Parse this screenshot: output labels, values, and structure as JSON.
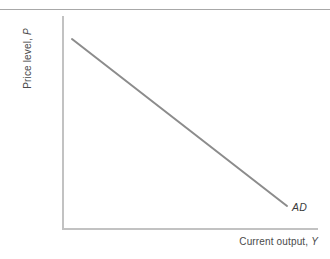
{
  "chart_data": {
    "type": "line",
    "title": "",
    "subtitle": "",
    "xlabel_text": "Current output,",
    "xlabel_symbol": "Y",
    "ylabel_text": "Price level,",
    "ylabel_symbol": "P",
    "grid": false,
    "legend": "none",
    "xlim": [
      0,
      1
    ],
    "ylim": [
      0,
      1
    ],
    "xticks": [],
    "yticks": [],
    "axis_color": "#c2c2c2",
    "rule_color": "#a8a8a8",
    "series": [
      {
        "name": "AD",
        "label": "AD",
        "label_style": "italic",
        "color": "#8c8c8c",
        "width": 2,
        "annotation": "Aggregate demand schedule: downward sloping straight line",
        "x": [
          0.039,
          1.0
        ],
        "y": [
          1.0,
          0.215
        ],
        "points_px": [
          [
            72,
            39
          ],
          [
            287,
            206
          ]
        ]
      }
    ]
  },
  "figure": {
    "width": 330,
    "height": 259,
    "background": "#ffffff"
  }
}
